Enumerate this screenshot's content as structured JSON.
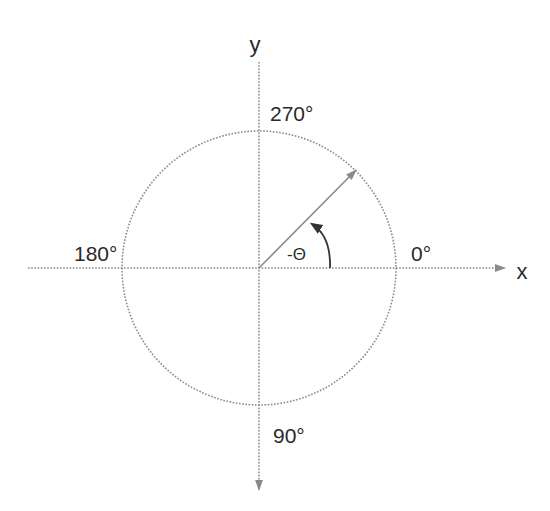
{
  "diagram": {
    "title": "",
    "axes": {
      "x_label": "x",
      "y_label": "y"
    },
    "angle_labels": {
      "deg_0": "0°",
      "deg_90": "90°",
      "deg_180": "180°",
      "deg_270": "270°"
    },
    "angle_symbol": "-Θ",
    "colors": {
      "line": "#8a8a8a",
      "text": "#2a2a2a",
      "arrow": "#333333"
    }
  }
}
